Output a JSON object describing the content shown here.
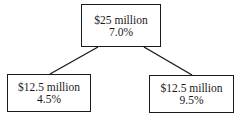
{
  "diagram": {
    "type": "tree",
    "root": {
      "amount": "$25 million",
      "rate": "7.0%"
    },
    "children": [
      {
        "amount": "$12.5 million",
        "rate": "4.5%"
      },
      {
        "amount": "$12.5 million",
        "rate": "9.5%"
      }
    ],
    "colors": {
      "line": "#1a1a1a",
      "background": "#ffffff"
    }
  }
}
